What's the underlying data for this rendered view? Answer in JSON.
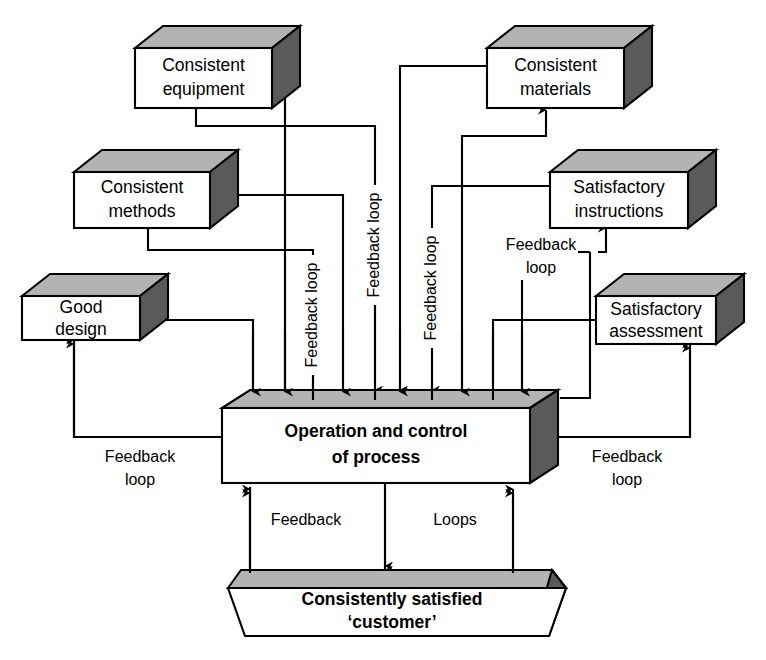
{
  "diagram": {
    "style": {
      "box_face": "#ffffff",
      "box_top": "#b3b3b3",
      "box_side": "#5a5a5a",
      "stroke": "#000000",
      "background": "#ffffff"
    },
    "nodes": [
      {
        "id": "consistent-equipment",
        "lines": [
          "Consistent",
          "equipment"
        ],
        "shape": "cube",
        "bold": false
      },
      {
        "id": "consistent-materials",
        "lines": [
          "Consistent",
          "materials"
        ],
        "shape": "cube",
        "bold": false
      },
      {
        "id": "consistent-methods",
        "lines": [
          "Consistent",
          "methods"
        ],
        "shape": "cube",
        "bold": false
      },
      {
        "id": "satisfactory-instructions",
        "lines": [
          "Satisfactory",
          "instructions"
        ],
        "shape": "cube",
        "bold": false
      },
      {
        "id": "good-design",
        "lines": [
          "Good",
          "design"
        ],
        "shape": "cube",
        "bold": false
      },
      {
        "id": "satisfactory-assessment",
        "lines": [
          "Satisfactory",
          "assessment"
        ],
        "shape": "cube",
        "bold": false
      },
      {
        "id": "operation-control",
        "lines": [
          "Operation and control",
          "of process"
        ],
        "shape": "cube",
        "bold": true
      },
      {
        "id": "consistently-satisfied-customer",
        "lines": [
          "Consistently satisfied",
          "‘customer’"
        ],
        "shape": "trapezoid",
        "bold": true
      }
    ],
    "edge_labels": [
      {
        "id": "fb-vertical-1",
        "text": "Feedback loop",
        "orientation": "vertical"
      },
      {
        "id": "fb-vertical-2",
        "text": "Feedback loop",
        "orientation": "vertical"
      },
      {
        "id": "fb-vertical-3",
        "text": "Feedback loop",
        "orientation": "vertical"
      },
      {
        "id": "fb-right-upper",
        "lines": [
          "Feedback",
          "loop"
        ],
        "orientation": "horizontal"
      },
      {
        "id": "fb-left-lower",
        "lines": [
          "Feedback",
          "loop"
        ],
        "orientation": "horizontal"
      },
      {
        "id": "fb-right-lower",
        "lines": [
          "Feedback",
          "loop"
        ],
        "orientation": "horizontal"
      },
      {
        "id": "fb-bottom-feedback",
        "text": "Feedback",
        "orientation": "horizontal"
      },
      {
        "id": "fb-bottom-loops",
        "text": "Loops",
        "orientation": "horizontal"
      }
    ]
  }
}
